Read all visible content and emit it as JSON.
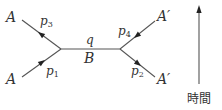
{
  "diagram": {
    "type": "feynman-scattering",
    "incoming": [
      {
        "particle": "A",
        "momentum": "p",
        "momentum_index": "1"
      },
      {
        "particle": "A",
        "momentum": "p",
        "momentum_index": "3"
      }
    ],
    "outgoing": [
      {
        "particle": "A′",
        "momentum": "p",
        "momentum_index": "4"
      },
      {
        "particle": "A′",
        "momentum": "p",
        "momentum_index": "2"
      }
    ],
    "propagator": {
      "particle": "B",
      "momentum": "q"
    },
    "time_axis": {
      "label": "時間"
    }
  }
}
